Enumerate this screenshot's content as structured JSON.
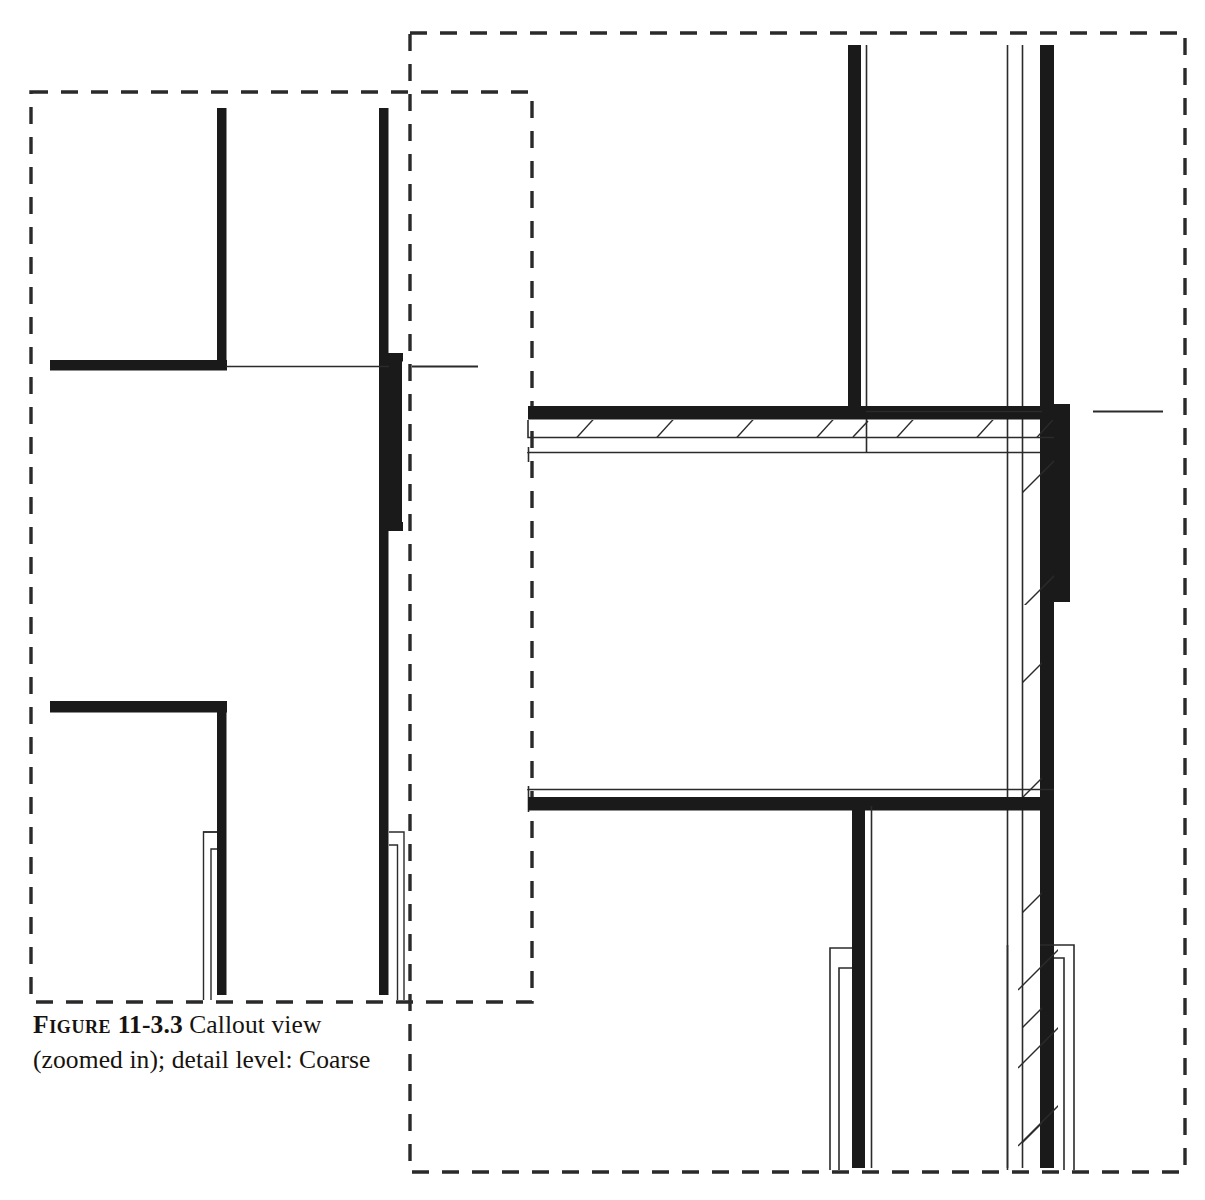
{
  "figure": {
    "label": "Figure",
    "number": "11-3.3",
    "caption_line1": "Callout view",
    "caption_line2": "(zoomed in); detail level: Coarse",
    "detail_level": "Coarse",
    "view_type": "Callout view (zoomed in)"
  },
  "colors": {
    "ink": "#16130f",
    "wall_fill": "#1a1a1a",
    "thin_line": "#2b2b2b",
    "dash_line": "#2a2a2a",
    "background": "#ffffff"
  },
  "callouts": [
    {
      "name": "left-callout-boundary",
      "x": 31,
      "y": 92,
      "width": 501,
      "height": 910,
      "style": "dashed",
      "detail_level": "Coarse"
    },
    {
      "name": "right-callout-boundary",
      "x": 410,
      "y": 33,
      "width": 775,
      "height": 1139,
      "style": "dashed",
      "detail_level": "Coarse"
    }
  ],
  "drawing": {
    "title": "Architectural wall section detail",
    "left_panel": {
      "name": "coarse-detail-panel",
      "description": "Walls shown as solid poche with no component layers",
      "vertical_walls": [
        {
          "name": "interior-wall-left",
          "x": 217,
          "y_top": 108,
          "y_bottom": 368,
          "thickness": 9
        },
        {
          "name": "exterior-wall-right-upper",
          "x": 379,
          "y_top": 108,
          "y_bottom": 357,
          "thickness": 9
        },
        {
          "name": "exterior-wall-right-jog",
          "x": 390,
          "y_top": 357,
          "y_bottom": 527,
          "thickness": 13
        },
        {
          "name": "exterior-wall-right-lower",
          "x": 379,
          "y_top": 527,
          "y_bottom": 995,
          "thickness": 10
        },
        {
          "name": "interior-wall-left-lower",
          "x": 217,
          "y_top": 702,
          "y_bottom": 995,
          "thickness": 9
        }
      ],
      "horizontal_walls": [
        {
          "name": "floor-band-upper",
          "x_start": 50,
          "x_end": 226,
          "y": 360,
          "thickness": 10
        },
        {
          "name": "floor-band-lower",
          "x_start": 50,
          "x_end": 226,
          "y": 702,
          "thickness": 11
        }
      ],
      "reference_lines": [
        {
          "name": "level-reference-line-upper",
          "x_start": 226,
          "x_end": 389,
          "y": 366
        },
        {
          "name": "level-reference-tick",
          "x_start": 412,
          "x_end": 478,
          "y": 366
        }
      ],
      "mullions": [
        {
          "name": "window-mullion-left-outer",
          "x": 204,
          "y_top": 832,
          "y_bottom": 997,
          "width": 14
        },
        {
          "name": "window-mullion-left-inner",
          "x": 210,
          "y_top": 850,
          "y_bottom": 997,
          "width": 9
        },
        {
          "name": "window-mullion-right-outer",
          "x": 390,
          "y_top": 832,
          "y_bottom": 997,
          "width": 14
        },
        {
          "name": "window-mullion-right-inner",
          "x": 393,
          "y_top": 845,
          "y_bottom": 997,
          "width": 9
        }
      ]
    },
    "right_panel": {
      "name": "layered-detail-panel",
      "description": "Walls and floors shown with hatched insulation/finish layer",
      "vertical_walls": [
        {
          "name": "interior-partition-upper",
          "x": 848,
          "y_top": 45,
          "y_bottom": 413,
          "thickness": 12
        },
        {
          "name": "interior-partition-face-line",
          "x": 866,
          "y_top": 45,
          "y_bottom": 452
        },
        {
          "name": "exterior-wall-main",
          "x": 1040,
          "y_top": 45,
          "y_bottom": 415,
          "thickness": 14
        },
        {
          "name": "exterior-wall-jog",
          "x": 1053,
          "y_top": 415,
          "y_bottom": 600,
          "thickness": 16
        },
        {
          "name": "exterior-wall-lower",
          "x": 1040,
          "y_top": 600,
          "y_bottom": 1165,
          "thickness": 14
        },
        {
          "name": "exterior-sheathing-line-1",
          "x": 1007,
          "y_top": 45,
          "y_bottom": 1165
        },
        {
          "name": "exterior-sheathing-line-2",
          "x": 1022,
          "y_top": 45,
          "y_bottom": 1165
        },
        {
          "name": "interior-partition-lower",
          "x": 852,
          "y_top": 798,
          "y_bottom": 1165,
          "thickness": 12
        }
      ],
      "horizontal_assemblies": [
        {
          "name": "floor-assembly-upper",
          "x_start": 528,
          "x_end": 1053,
          "slab_y": 407,
          "slab_thickness": 13,
          "hatch_y": 420,
          "hatch_thickness": 17,
          "soffit_line_y": 452
        },
        {
          "name": "floor-assembly-lower",
          "x_start": 528,
          "x_end": 1053,
          "ceiling_line_y": 789,
          "slab_y": 798,
          "slab_thickness": 13
        }
      ],
      "reference_lines": [
        {
          "name": "level-reference-line",
          "x_start": 1066,
          "x_end": 1082,
          "y": 411
        },
        {
          "name": "level-reference-tick",
          "x_start": 1093,
          "x_end": 1163,
          "y": 411
        }
      ],
      "mullions": [
        {
          "name": "window-mullion-left-outer",
          "x": 831,
          "y_top": 948,
          "y_bottom": 1165,
          "width": 18
        },
        {
          "name": "window-mullion-left-inner",
          "x": 838,
          "y_top": 968,
          "y_bottom": 1165,
          "width": 11
        },
        {
          "name": "window-mullion-right-outer",
          "x": 1050,
          "y_top": 945,
          "y_bottom": 1165,
          "width": 22
        },
        {
          "name": "window-mullion-right-inner",
          "x": 1056,
          "y_top": 958,
          "y_bottom": 1165,
          "width": 13
        }
      ],
      "hatch_pattern": {
        "name": "diagonal-hatch",
        "angle_deg": 45,
        "spacing": 60
      }
    }
  }
}
